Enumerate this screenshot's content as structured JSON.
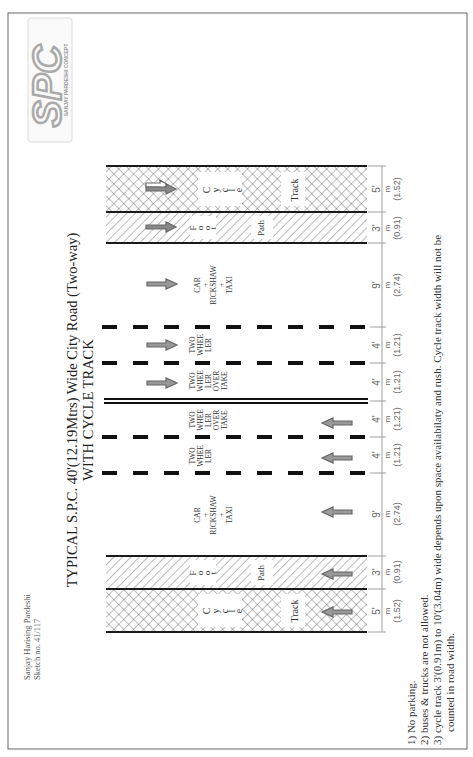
{
  "title": {
    "line1": "TYPICAL S.P.C. 40'(12.19Mtrs) Wide City Road (Two-way)",
    "line2": "WITH CYCLE TRACK"
  },
  "logo": {
    "letters": "SPC",
    "tagline": "SANJAY PARDESHI CONCEPT"
  },
  "author": {
    "name": "Sanjay Harising Pardeshi",
    "sketch": "Sketch no. 41/117"
  },
  "notes": [
    "1) No parking.",
    "2) buses & trucks are not allowed.",
    "3) cycle track 3'(0.91m) to 10'(3.04m)  wide depends  upon space availabilaty and rush. Cycle  track width will not be",
    "counted in road width."
  ],
  "zones": {
    "cycle_track": {
      "c": "C",
      "y": "y",
      "c2": "c",
      "l": "l",
      "e": "e",
      "track": "Track"
    },
    "foot_path": {
      "f": "F",
      "o": "o",
      "o2": "o",
      "t": "t",
      "path": "Path"
    },
    "car_lane": {
      "l1": "CAR",
      "l2": "+",
      "l3": "RICKSHAW",
      "l4": "+",
      "l5": "TAXI"
    },
    "two_wheeler": {
      "l1": "TWO",
      "l2": "WHEE",
      "l3": "LER"
    },
    "two_wheeler_overtake": {
      "l1": "TWO",
      "l2": "WHEE",
      "l3": "LER",
      "l4": "OVER",
      "l5": "TAKE"
    }
  },
  "dimensions": {
    "unit_m": "m",
    "items": [
      {
        "ft": "5'",
        "m": "(1.52)"
      },
      {
        "ft": "3'",
        "m": "(0.91)"
      },
      {
        "ft": "9'",
        "m": "(2.74)"
      },
      {
        "ft": "4'",
        "m": "(1.21)"
      },
      {
        "ft": "4'",
        "m": "(1.21)"
      },
      {
        "ft": "4'",
        "m": "(1.21)"
      },
      {
        "ft": "4'",
        "m": "(1.21)"
      },
      {
        "ft": "9'",
        "m": "(2.74)"
      },
      {
        "ft": "3'",
        "m": "(0.91)"
      },
      {
        "ft": "5'",
        "m": "(1.52)"
      }
    ]
  },
  "colors": {
    "line": "#1a1a1a",
    "hatch": "#555555",
    "arrow": "#777777",
    "dim": "#888888",
    "logo": "#b5b5b5"
  }
}
